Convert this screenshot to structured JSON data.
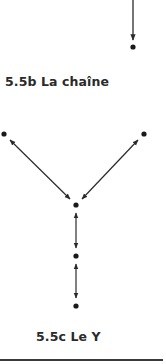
{
  "figures": [
    {
      "id": "5.5b",
      "caption": "5.5b La chaîne"
    },
    {
      "id": "5.5c",
      "caption": "5.5c Le Y"
    }
  ],
  "diagram": {
    "line_color": "#2a2a2a",
    "node_color": "#1a1a1a",
    "nodes": [
      {
        "id": "chain-end",
        "x": 133,
        "y": 47
      },
      {
        "id": "y-left",
        "x": 4,
        "y": 134
      },
      {
        "id": "y-right",
        "x": 144,
        "y": 134
      },
      {
        "id": "y-center",
        "x": 76,
        "y": 205
      },
      {
        "id": "y-middle",
        "x": 76,
        "y": 256
      },
      {
        "id": "y-bottom",
        "x": 76,
        "y": 306
      }
    ],
    "edges": [
      {
        "from": "top-edge",
        "to": "chain-end",
        "type": "one-way"
      },
      {
        "from": "y-left",
        "to": "y-center",
        "type": "two-way"
      },
      {
        "from": "y-right",
        "to": "y-center",
        "type": "two-way"
      },
      {
        "from": "y-center",
        "to": "y-middle",
        "type": "two-way"
      },
      {
        "from": "y-middle",
        "to": "y-bottom",
        "type": "two-way"
      }
    ]
  }
}
